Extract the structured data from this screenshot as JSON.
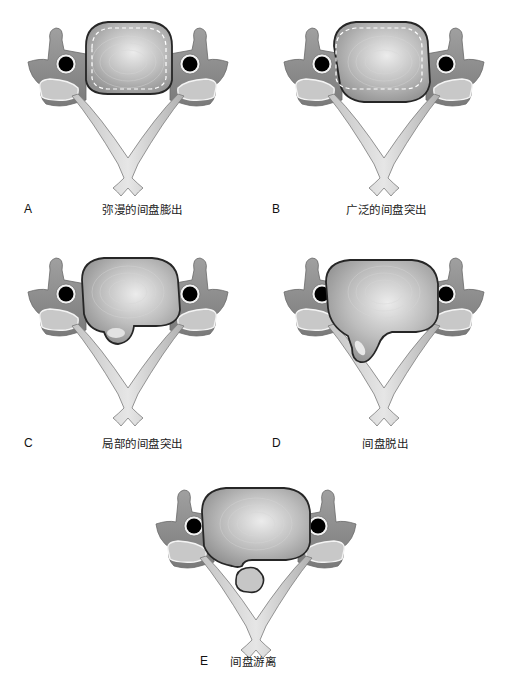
{
  "figure": {
    "panels": [
      {
        "id": "A",
        "letter": "A",
        "caption": "弥漫的间盘膨出",
        "type": "diffuse-bulge"
      },
      {
        "id": "B",
        "letter": "B",
        "caption": "广泛的间盘突出",
        "type": "broad-protrusion"
      },
      {
        "id": "C",
        "letter": "C",
        "caption": "局部的间盘突出",
        "type": "focal-protrusion"
      },
      {
        "id": "D",
        "letter": "D",
        "caption": "间盘脱出",
        "type": "extrusion"
      },
      {
        "id": "E",
        "letter": "E",
        "caption": "间盘游离",
        "type": "sequestration"
      }
    ],
    "colors": {
      "bone_dark": "#8a8a8a",
      "bone_light": "#d8d8d8",
      "disc_outline": "#2a2a2a",
      "disc_center": "#e6e6e6",
      "disc_edge": "#9a9a9a",
      "foramen": "#000000",
      "background": "#ffffff"
    }
  }
}
